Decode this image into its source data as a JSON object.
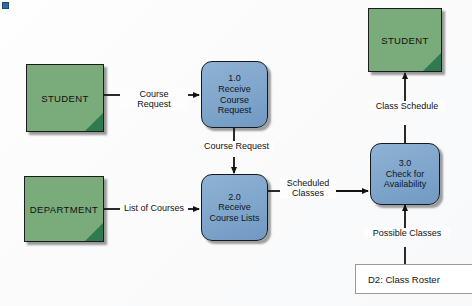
{
  "diagram": {
    "type": "data-flow-diagram",
    "colors": {
      "entity_fill": "#7aab7a",
      "entity_corner": "#2f7a4e",
      "process_fill": "#7fa5cb",
      "datastore_stroke": "#9a9a9a",
      "line": "#121212",
      "marker": "#2e6da8",
      "background": "#fdfdfd"
    },
    "marker": {
      "name": "bullet-marker"
    },
    "entities": [
      {
        "id": "student-left",
        "label": "STUDENT"
      },
      {
        "id": "department",
        "label": "DEPARTMENT"
      },
      {
        "id": "student-top",
        "label": "STUDENT"
      }
    ],
    "processes": [
      {
        "id": "process-1",
        "number": "1.0",
        "name": "Receive\nCourse\nRequest"
      },
      {
        "id": "process-2",
        "number": "2.0",
        "name": "Receive\nCourse Lists"
      },
      {
        "id": "process-3",
        "number": "3.0",
        "name": "Check for\nAvailability"
      }
    ],
    "datastores": [
      {
        "id": "d2",
        "label": "D2: Class Roster"
      }
    ],
    "flows": [
      {
        "id": "flow-course-request-in",
        "label": "Course Request"
      },
      {
        "id": "flow-course-request-down",
        "label": "Course Request"
      },
      {
        "id": "flow-list-of-courses",
        "label": "List of Courses"
      },
      {
        "id": "flow-scheduled-classes",
        "label": "Scheduled\nClasses"
      },
      {
        "id": "flow-class-schedule",
        "label": "Class Schedule"
      },
      {
        "id": "flow-possible-classes",
        "label": "Possible Classes"
      }
    ]
  }
}
